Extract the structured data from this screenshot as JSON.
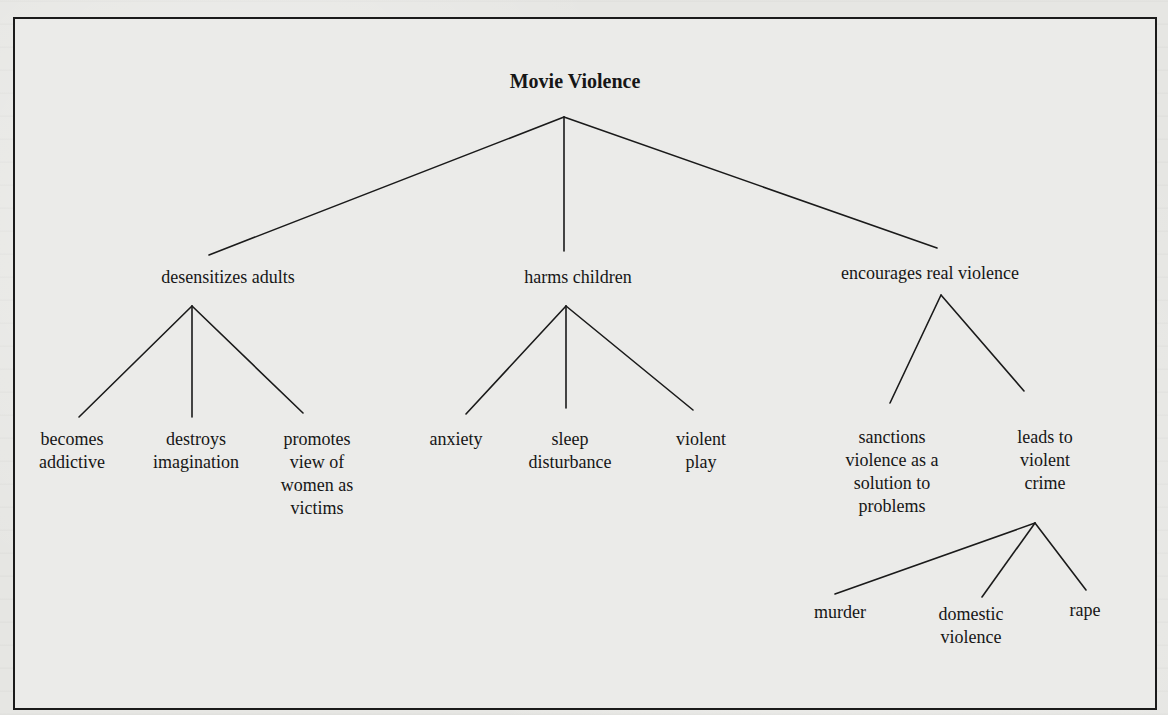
{
  "diagram": {
    "title": "Movie Violence",
    "root": {
      "label": "Movie Violence",
      "children": [
        {
          "label": "desensitizes adults",
          "children": [
            {
              "lines": [
                "becomes",
                "addictive"
              ]
            },
            {
              "lines": [
                "destroys",
                "imagination"
              ]
            },
            {
              "lines": [
                "promotes",
                "view of",
                "women as",
                "victims"
              ]
            }
          ]
        },
        {
          "label": "harms children",
          "children": [
            {
              "lines": [
                "anxiety"
              ]
            },
            {
              "lines": [
                "sleep",
                "disturbance"
              ]
            },
            {
              "lines": [
                "violent",
                "play"
              ]
            }
          ]
        },
        {
          "label": "encourages real violence",
          "children": [
            {
              "lines": [
                "sanctions",
                "violence as a",
                "solution to",
                "problems"
              ]
            },
            {
              "lines": [
                "leads to",
                "violent",
                "crime"
              ],
              "children": [
                {
                  "lines": [
                    "murder"
                  ]
                },
                {
                  "lines": [
                    "domestic",
                    "violence"
                  ]
                },
                {
                  "lines": [
                    "rape"
                  ]
                }
              ]
            }
          ]
        }
      ]
    }
  },
  "colors": {
    "background": "#e6e6e3",
    "frame_fill": "#ebebe9",
    "ink": "#161616"
  }
}
